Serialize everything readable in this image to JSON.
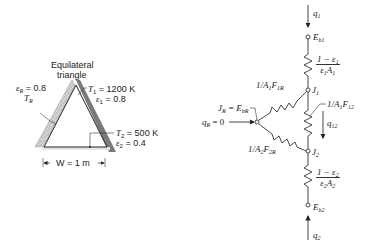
{
  "left_figure": {
    "title_line1": "Equilateral",
    "title_line2": "triangle",
    "eps_R": "ε",
    "eps_R_sub": "R",
    "eps_R_val": " = 0.8",
    "T_R": "T",
    "T_R_sub": "R",
    "T1": "T",
    "T1_sub": "1",
    "T1_val": " = 1200 K",
    "eps1": "ε",
    "eps1_sub": "1",
    "eps1_val": " = 0.8",
    "T2": "T",
    "T2_sub": "2",
    "T2_val": " = 500 K",
    "eps2": "ε",
    "eps2_sub": "2",
    "eps2_val": " = 0.4",
    "width_label": "W = 1 m"
  },
  "network": {
    "q1": "q",
    "q1_sub": "1",
    "Eb1": "E",
    "Eb1_sub": "b1",
    "R1_num": "1 − ε",
    "R1_num_sub": "1",
    "R1_den": "ε",
    "R1_den_sub": "1",
    "R1_den2": "A",
    "R1_den2_sub": "1",
    "J1": "J",
    "J1_sub": "1",
    "R1R": "1/A",
    "R1R_sub1": "1",
    "R1R_F": "F",
    "R1R_sub2": "1R",
    "R12": "1/A",
    "R12_sub1": "1",
    "R12_F": "F",
    "R12_sub2": "12",
    "JR": "J",
    "JR_sub": "R",
    "JR_eq": " = E",
    "JR_eq_sub": "bR",
    "qR": "q",
    "qR_sub": "R",
    "qR_val": " = 0",
    "q12": "q",
    "q12_sub": "12",
    "R2R": "1/A",
    "R2R_sub1": "2",
    "R2R_F": "F",
    "R2R_sub2": "2R",
    "J2": "J",
    "J2_sub": "2",
    "R2_num": "1 − ε",
    "R2_num_sub": "2",
    "R2_den": "ε",
    "R2_den_sub": "2",
    "R2_den2": "A",
    "R2_den2_sub": "2",
    "Eb2": "E",
    "Eb2_sub": "b2",
    "q2": "q",
    "q2_sub": "2"
  },
  "colors": {
    "line": "#333333",
    "wall_dark": "#7a7a7a",
    "wall_speckled": "#c8c8c8"
  }
}
